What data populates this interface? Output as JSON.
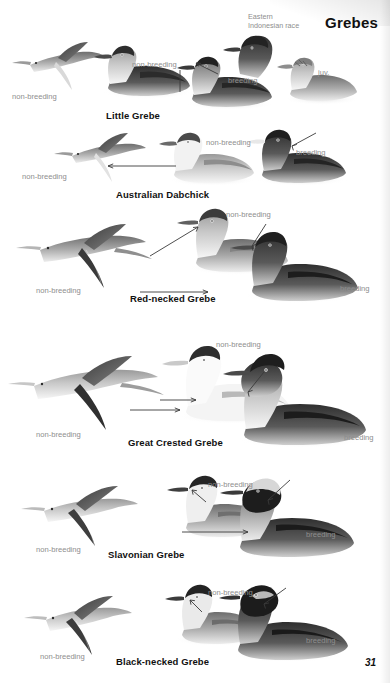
{
  "page": {
    "title": "Grebes",
    "number": "31",
    "race_note": [
      "Eastern",
      "Indonesian race"
    ]
  },
  "labels": {
    "non_breeding": "non-breeding",
    "breeding": "breeding",
    "juvenile": "juv."
  },
  "species": [
    {
      "name": "Little Grebe",
      "plates": [
        {
          "pose": "flight",
          "label": "non-breeding"
        },
        {
          "pose": "swimming",
          "label": "non-breeding"
        },
        {
          "pose": "head",
          "label": "breeding"
        },
        {
          "pose": "swimming",
          "label": "breeding"
        },
        {
          "pose": "swimming",
          "label": "juv."
        }
      ]
    },
    {
      "name": "Australian Dabchick",
      "plates": [
        {
          "pose": "flight",
          "label": "non-breeding"
        },
        {
          "pose": "swimming",
          "label": "non-breeding"
        },
        {
          "pose": "swimming",
          "label": "breeding"
        }
      ]
    },
    {
      "name": "Red-necked Grebe",
      "plates": [
        {
          "pose": "flight",
          "label": "non-breeding"
        },
        {
          "pose": "swimming",
          "label": "non-breeding"
        },
        {
          "pose": "swimming",
          "label": "breeding"
        }
      ]
    },
    {
      "name": "Great Crested Grebe",
      "plates": [
        {
          "pose": "flight",
          "label": "non-breeding"
        },
        {
          "pose": "swimming",
          "label": "non-breeding"
        },
        {
          "pose": "swimming",
          "label": "breeding"
        }
      ]
    },
    {
      "name": "Slavonian Grebe",
      "plates": [
        {
          "pose": "flight",
          "label": "non-breeding"
        },
        {
          "pose": "swimming",
          "label": "non-breeding"
        },
        {
          "pose": "swimming",
          "label": "breeding"
        }
      ]
    },
    {
      "name": "Black-necked Grebe",
      "plates": [
        {
          "pose": "flight",
          "label": "non-breeding"
        },
        {
          "pose": "swimming",
          "label": "non-breeding"
        },
        {
          "pose": "swimming",
          "label": "breeding"
        }
      ]
    }
  ],
  "colors": {
    "ink": "#111111",
    "label_grey": "#8e8e8e",
    "plate_dark": "#3a3a3a",
    "plate_mid": "#8a8a8a",
    "plate_light": "#d8d8d8",
    "background": "#ffffff"
  }
}
